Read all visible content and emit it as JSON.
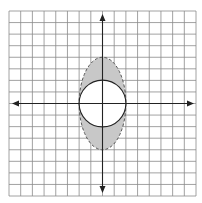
{
  "diagram": {
    "type": "coordinate-plane-region",
    "grid": {
      "cells_x": 16,
      "cells_y": 16,
      "x_min": -8,
      "x_max": 8,
      "y_min": -8,
      "y_max": 8
    },
    "axes": {
      "x_axis": "horizontal with arrows both ends",
      "y_axis": "vertical with arrows both ends"
    },
    "shapes": [
      {
        "name": "ellipse",
        "center": [
          0,
          0
        ],
        "semi_axis_x": 2,
        "semi_axis_y": 4,
        "stroke": "dashed",
        "color": "#555555"
      },
      {
        "name": "circle",
        "center": [
          0,
          0
        ],
        "radius": 2,
        "stroke": "solid",
        "color": "#222222"
      }
    ],
    "shaded_region": {
      "description": "inside ellipse, outside circle",
      "fill": "#c8c8c8"
    },
    "colors": {
      "grid": "#8a8a8a",
      "axis": "#222222",
      "shade": "#c8c8c8",
      "background": "#ffffff"
    }
  }
}
